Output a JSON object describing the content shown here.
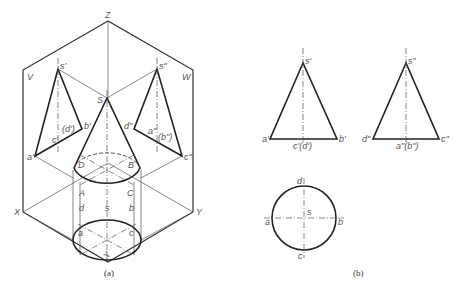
{
  "figure_a": {
    "caption": "(a)",
    "axes": {
      "Z": "Z",
      "X": "X",
      "Y": "Y",
      "Yh": "Y"
    },
    "planes": {
      "V": "V",
      "W": "W"
    },
    "points": {
      "s_v": "s'",
      "s_w": "s\"",
      "S": "S",
      "a_v": "a'",
      "b_v": "b'",
      "c_v": "c'",
      "d_v": "(d')",
      "d_w": "d\"",
      "a_w": "a\"",
      "b_w": "(b\")",
      "c_w": "c\"",
      "A": "A",
      "B": "B",
      "C": "C",
      "D": "D",
      "a_h": "a",
      "b_h": "b",
      "c_h": "c",
      "d_h": "d",
      "s_h": "s"
    }
  },
  "figure_b": {
    "caption": "(b)",
    "front_view": {
      "apex": "s'",
      "left": "a'",
      "right": "b'",
      "mid": "c'(d')"
    },
    "side_view": {
      "apex": "s\"",
      "left": "d\"",
      "right": "c\"",
      "mid": "a\"(b\")"
    },
    "top_view": {
      "top": "d",
      "bottom": "c",
      "left": "a",
      "right": "b",
      "center": "s"
    }
  }
}
